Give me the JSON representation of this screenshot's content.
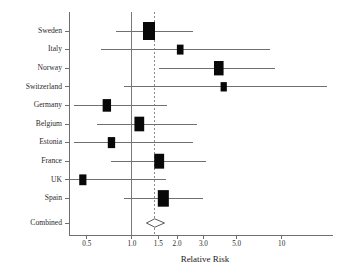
{
  "chart_data": {
    "type": "scatter",
    "plot_style": "forest-plot",
    "title": "",
    "xlabel": "Relative Risk",
    "ylabel": "",
    "x_scale": "log",
    "xlim": [
      0.38,
      22.0
    ],
    "grid": false,
    "legend": null,
    "xticks": [
      0.5,
      1.0,
      1.5,
      2.0,
      3.0,
      5.0,
      10.0
    ],
    "xtick_labels": [
      "0.5",
      "1.0",
      "1.5",
      "2.0",
      "3.0",
      "5.0",
      "10"
    ],
    "reference_lines": [
      {
        "name": "null-effect",
        "x": 1.0,
        "style": "solid"
      },
      {
        "name": "pooled-estimate",
        "x": 1.42,
        "style": "dashed"
      }
    ],
    "categories": [
      "Sweden",
      "Italy",
      "Norway",
      "Switzerland",
      "Germany",
      "Belgium",
      "Estonia",
      "France",
      "UK",
      "Spain",
      "Combined"
    ],
    "studies": [
      {
        "label": "Sweden",
        "rr": 1.3,
        "ci_low": 0.78,
        "ci_high": 2.55,
        "weight": 1.0
      },
      {
        "label": "Italy",
        "rr": 2.1,
        "ci_low": 0.62,
        "ci_high": 8.4,
        "weight": 0.33
      },
      {
        "label": "Norway",
        "rr": 3.8,
        "ci_low": 1.52,
        "ci_high": 9.0,
        "weight": 0.7
      },
      {
        "label": "Switzerland",
        "rr": 4.1,
        "ci_low": 0.88,
        "ci_high": 20.0,
        "weight": 0.28
      },
      {
        "label": "Germany",
        "rr": 0.68,
        "ci_low": 0.41,
        "ci_high": 1.72,
        "weight": 0.55
      },
      {
        "label": "Belgium",
        "rr": 1.12,
        "ci_low": 0.58,
        "ci_high": 2.7,
        "weight": 0.72
      },
      {
        "label": "Estonia",
        "rr": 0.73,
        "ci_low": 0.41,
        "ci_high": 2.55,
        "weight": 0.42
      },
      {
        "label": "France",
        "rr": 1.52,
        "ci_low": 0.72,
        "ci_high": 3.1,
        "weight": 0.74
      },
      {
        "label": "UK",
        "rr": 0.47,
        "ci_low": 0.38,
        "ci_high": 1.7,
        "weight": 0.4
      },
      {
        "label": "Spain",
        "rr": 1.62,
        "ci_low": 0.88,
        "ci_high": 3.0,
        "weight": 0.88
      }
    ],
    "combined": {
      "label": "Combined",
      "rr": 1.42,
      "ci_low": 1.25,
      "ci_high": 1.65,
      "marker": "diamond"
    }
  },
  "colors": {
    "marker": "#080808",
    "ci_line": "#707070",
    "axis": "#6e6e6e",
    "null_line": "#7a7a7a",
    "pooled_line": "#8a8a8a",
    "background": "#ffffff"
  }
}
